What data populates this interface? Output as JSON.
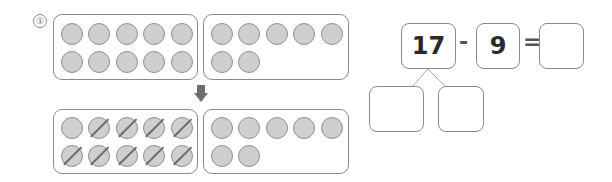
{
  "problem_number": "①",
  "top_row": {
    "left_frame": {
      "dots": 10,
      "crossed": 0
    },
    "right_frame": {
      "dots": 7,
      "crossed": 0
    }
  },
  "arrow": "down-arrow",
  "bottom_row": {
    "left_frame": {
      "dots": 10,
      "crossed": 9
    },
    "right_frame": {
      "dots": 7,
      "crossed": 0
    }
  },
  "equation": {
    "minuend": "17",
    "operator": "-",
    "subtrahend": "9",
    "equals": "=",
    "answer": ""
  },
  "decomposition": {
    "left": "",
    "right": ""
  }
}
